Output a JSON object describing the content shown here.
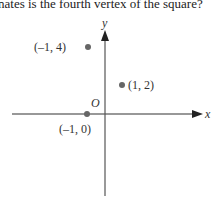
{
  "question_text": "nates is the fourth vertex of the square?",
  "axes": {
    "x_label": "x",
    "y_label": "y",
    "origin_label": "O"
  },
  "points": [
    {
      "label": "(–1, 4)",
      "x": -1,
      "y": 4
    },
    {
      "label": "(1, 2)",
      "x": 1,
      "y": 2
    },
    {
      "label": "(–1, 0)",
      "x": -1,
      "y": 0
    }
  ],
  "colors": {
    "axis": "#333333",
    "point": "#666666"
  }
}
